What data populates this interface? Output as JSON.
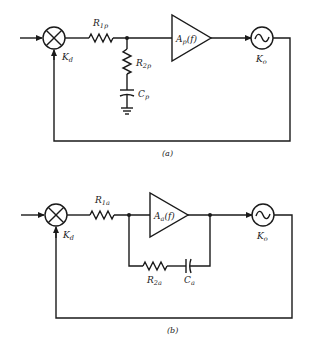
{
  "diagrams": [
    {
      "id": "a",
      "caption": "(a)",
      "phase_detector": {
        "label": "K",
        "sub": "d"
      },
      "resistor1": {
        "label": "R",
        "sub": "1p"
      },
      "resistor2": {
        "label": "R",
        "sub": "2p"
      },
      "capacitor": {
        "label": "C",
        "sub": "p"
      },
      "amplifier": {
        "label": "A",
        "sub": "p",
        "suffix": "(f)"
      },
      "vco": {
        "label": "K",
        "sub": "o",
        "symbol": "~"
      }
    },
    {
      "id": "b",
      "caption": "(b)",
      "phase_detector": {
        "label": "K",
        "sub": "d"
      },
      "resistor1": {
        "label": "R",
        "sub": "1a"
      },
      "resistor2": {
        "label": "R",
        "sub": "2a"
      },
      "capacitor": {
        "label": "C",
        "sub": "a"
      },
      "amplifier": {
        "label": "A",
        "sub": "a",
        "suffix": "(f)"
      },
      "vco": {
        "label": "K",
        "sub": "o",
        "symbol": "~"
      }
    }
  ]
}
